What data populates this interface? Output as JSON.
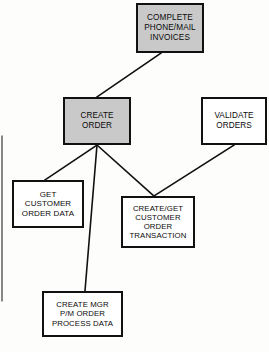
{
  "diagram": {
    "background_color": "#fdfdfb",
    "shaded_fill": "#c9c9c9",
    "plain_fill": "#ffffff",
    "stroke_color": "#111111",
    "nodes": [
      {
        "id": "complete-phone-mail-invoices",
        "name": "complete-phone-mail-invoices-box",
        "lines": [
          "COMPLETE",
          "PHONE/MAIL",
          "INVOICES"
        ],
        "fill": "shaded",
        "x": 136,
        "y": 3,
        "w": 68,
        "h": 50,
        "font_size": 8.2
      },
      {
        "id": "create-order",
        "name": "create-order-box",
        "lines": [
          "CREATE",
          "ORDER"
        ],
        "fill": "shaded",
        "x": 63,
        "y": 97,
        "w": 68,
        "h": 48,
        "font_size": 8.2
      },
      {
        "id": "validate-orders",
        "name": "validate-orders-box",
        "lines": [
          "VALIDATE",
          "ORDERS"
        ],
        "fill": "plain",
        "x": 201,
        "y": 97,
        "w": 66,
        "h": 48,
        "font_size": 8.2
      },
      {
        "id": "get-customer-order-data",
        "name": "get-customer-order-data-box",
        "lines": [
          "GET",
          "CUSTOMER",
          "ORDER DATA"
        ],
        "fill": "plain",
        "x": 12,
        "y": 180,
        "w": 72,
        "h": 48,
        "font_size": 8.0
      },
      {
        "id": "create-get-customer-order-transaction",
        "name": "create-get-customer-order-transaction-box",
        "lines": [
          "CREATE/GET",
          "CUSTOMER",
          "ORDER",
          "TRANSACTION"
        ],
        "fill": "plain",
        "x": 121,
        "y": 196,
        "w": 74,
        "h": 52,
        "font_size": 7.8
      },
      {
        "id": "create-mgr-pm-order-process-data",
        "name": "create-mgr-pm-order-process-data-box",
        "lines": [
          "CREATE MGR",
          "P/M ORDER",
          "PROCESS DATA"
        ],
        "fill": "plain",
        "x": 42,
        "y": 291,
        "w": 81,
        "h": 46,
        "font_size": 7.8
      }
    ],
    "edges": [
      {
        "id": "invoices-to-create-order",
        "name": "edge-invoices-to-create-order",
        "x1": 161,
        "y1": 53,
        "x2": 97,
        "y2": 97
      },
      {
        "id": "create-order-to-get-customer",
        "name": "edge-create-order-to-get-customer",
        "x1": 97,
        "y1": 145,
        "x2": 45,
        "y2": 180
      },
      {
        "id": "create-order-to-create-mgr",
        "name": "edge-create-order-to-create-mgr",
        "x1": 97,
        "y1": 145,
        "x2": 85,
        "y2": 291
      },
      {
        "id": "create-order-to-transaction",
        "name": "edge-create-order-to-transaction",
        "x1": 97,
        "y1": 145,
        "x2": 154,
        "y2": 196
      },
      {
        "id": "validate-orders-to-transaction",
        "name": "edge-validate-orders-to-transaction",
        "x1": 234,
        "y1": 145,
        "x2": 154,
        "y2": 196
      },
      {
        "id": "left-margin-rule",
        "name": "edge-left-margin-rule",
        "x1": 2,
        "y1": 136,
        "x2": 2,
        "y2": 301
      }
    ]
  }
}
